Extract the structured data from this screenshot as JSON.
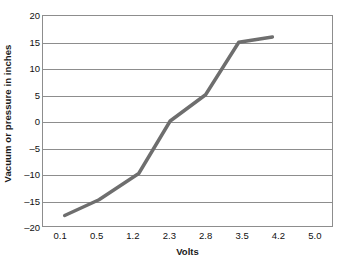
{
  "chart_data": {
    "type": "line",
    "title": "",
    "xlabel": "Volts",
    "ylabel": "Vacuum or pressure in inches",
    "grid": true,
    "legend": "none",
    "x_tick_labels": [
      "0.1",
      "0.5",
      "1.2",
      "2.3",
      "2.8",
      "3.5",
      "4.2",
      "5.0"
    ],
    "y_tick_labels": [
      "20",
      "15",
      "10",
      "5",
      "0",
      "–5",
      "–10",
      "–15",
      "–20"
    ],
    "ylim": [
      -20,
      20
    ],
    "y_ticks": [
      20,
      15,
      10,
      5,
      0,
      -5,
      -10,
      -15,
      -20
    ],
    "x_axis_note": "Tick labels are evenly spaced categories, not linear values",
    "series": [
      {
        "name": "Vacuum / pressure response",
        "color": "#6e6e6e",
        "line_width_px": 3.5,
        "points": [
          {
            "volts": "0.1",
            "x_pos": 0.1,
            "value": -18
          },
          {
            "volts": "0.5",
            "x_pos": 1.05,
            "value": -15
          },
          {
            "volts": "1.2",
            "x_pos": 2.15,
            "value": -10
          },
          {
            "volts": "2.3",
            "x_pos": 3.02,
            "value": 0
          },
          {
            "volts": "2.8",
            "x_pos": 4.0,
            "value": 5
          },
          {
            "volts": "3.5",
            "x_pos": 4.92,
            "value": 15
          },
          {
            "volts": "4.2",
            "x_pos": 5.85,
            "value": 16
          }
        ]
      }
    ]
  },
  "colors": {
    "line": "#6e6e6e",
    "grid": "#8d8d8d",
    "frame": "#8d8d8d",
    "text": "#111111",
    "background": "#ffffff"
  }
}
